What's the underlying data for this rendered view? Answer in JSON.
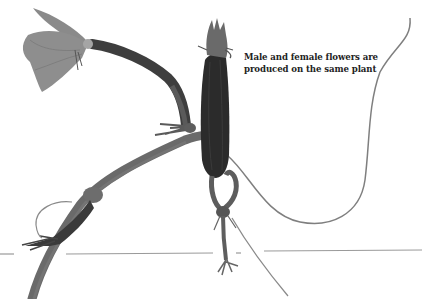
{
  "image": {
    "subject": "cucumber plant stem with flowers and tendrils",
    "background_color": "#ffffff"
  },
  "caption": {
    "lines": [
      "Male and female flowers are",
      "produced on the same plant"
    ]
  },
  "elements": {
    "male_flower": "open flower on long stalk, upper left",
    "female_flower": "elongated ovary with bud, center",
    "tendrils": "curling tendrils, right and lower left",
    "ground_line": "thin gray horizontal line near bottom"
  },
  "colors": {
    "stem": "#5a5a5a",
    "ovary": "#2a2a2a",
    "petal": "#8e8e8e",
    "tendril": "#7a7a7a",
    "ground_line": "#9a9a9a",
    "text": "#222222"
  }
}
